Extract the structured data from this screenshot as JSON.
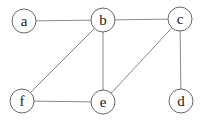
{
  "graph": {
    "nodes": [
      {
        "id": "a",
        "label": "a",
        "x": 24,
        "y": 21
      },
      {
        "id": "b",
        "label": "b",
        "x": 103,
        "y": 20
      },
      {
        "id": "c",
        "label": "c",
        "x": 180,
        "y": 19
      },
      {
        "id": "d",
        "label": "d",
        "x": 181,
        "y": 101
      },
      {
        "id": "e",
        "label": "e",
        "x": 103,
        "y": 102
      },
      {
        "id": "f",
        "label": "f",
        "x": 22,
        "y": 101
      }
    ],
    "edges": [
      [
        "a",
        "b"
      ],
      [
        "b",
        "c"
      ],
      [
        "b",
        "f"
      ],
      [
        "b",
        "e"
      ],
      [
        "c",
        "e"
      ],
      [
        "c",
        "d"
      ],
      [
        "f",
        "e"
      ]
    ],
    "node_radius": 12,
    "colors": {
      "edge": "#6a6a6a",
      "node_stroke": "#555555",
      "label": "#222222",
      "background": "#ffffff"
    }
  }
}
